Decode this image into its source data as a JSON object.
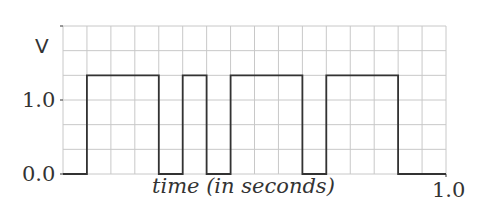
{
  "chart_data": {
    "type": "line",
    "subtype": "step",
    "title": "",
    "xlabel": "time (in seconds)",
    "ylabel": "V",
    "xlim": [
      0.0,
      1.0
    ],
    "ylim": [
      0.0,
      1.5
    ],
    "grid": true,
    "grid_x_divisions": 16,
    "grid_y_divisions": 6,
    "x_tick_labels": [
      "1.0"
    ],
    "y_tick_labels": [
      "0.0",
      "1.0"
    ],
    "series": [
      {
        "name": "signal",
        "x": [
          0.0,
          0.0625,
          0.0625,
          0.25,
          0.25,
          0.3125,
          0.3125,
          0.375,
          0.375,
          0.4375,
          0.4375,
          0.625,
          0.625,
          0.6875,
          0.6875,
          0.875,
          0.875,
          1.0
        ],
        "values": [
          0,
          0,
          1,
          1,
          0,
          0,
          1,
          1,
          0,
          0,
          1,
          1,
          0,
          0,
          1,
          1,
          0,
          0
        ]
      }
    ]
  },
  "labels": {
    "y_unit": "V",
    "y_one": "1.0",
    "y_zero": "0.0",
    "x_end": "1.0",
    "x_title": "time (in seconds)"
  },
  "colors": {
    "grid": "#c8c8c8",
    "signal": "#333333",
    "axis": "#555555"
  }
}
